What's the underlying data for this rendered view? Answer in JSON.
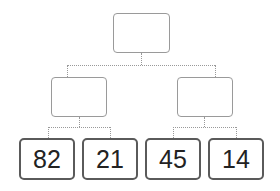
{
  "diagram": {
    "type": "binary-tree",
    "root": {
      "label": ""
    },
    "internal_nodes": [
      {
        "label": ""
      },
      {
        "label": ""
      }
    ],
    "leaves": [
      {
        "label": "82"
      },
      {
        "label": "21"
      },
      {
        "label": "45"
      },
      {
        "label": "14"
      }
    ]
  }
}
